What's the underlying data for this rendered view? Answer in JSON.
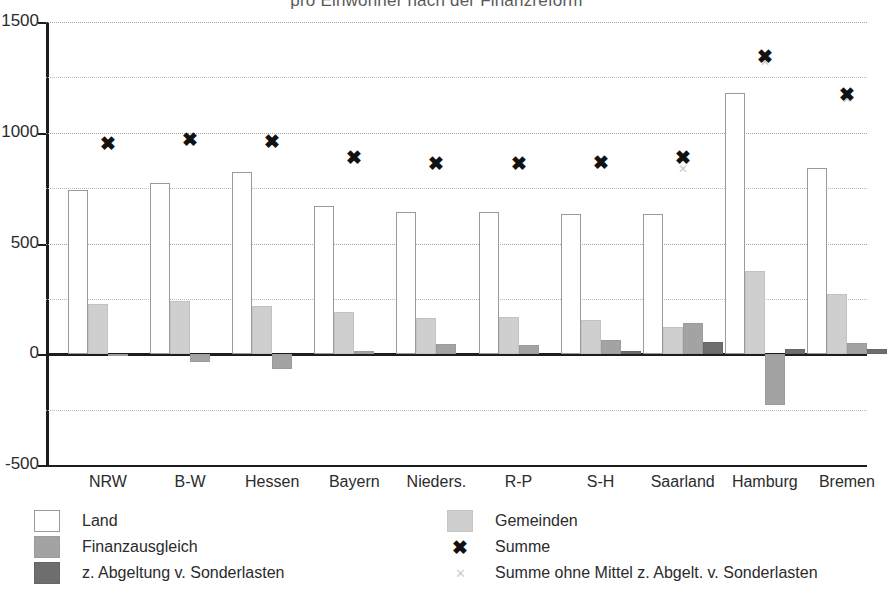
{
  "chart_data": {
    "type": "bar",
    "title": "pro Einwohner nach der Finanzreform",
    "xlabel": "",
    "ylabel": "",
    "ylim": [
      -500,
      1500
    ],
    "yticks": [
      1500,
      1000,
      500,
      0,
      -500
    ],
    "ytick_labels": [
      "1500",
      "1000",
      "500",
      "0",
      "-500"
    ],
    "grid": true,
    "grid_step": 250,
    "legend_position": "bottom",
    "categories": [
      "NRW",
      "B-W",
      "Hessen",
      "Bayern",
      "Nieders.",
      "R-P",
      "S-H",
      "Saarland",
      "Hamburg",
      "Bremen"
    ],
    "series": [
      {
        "name": "Land",
        "color": "#ffffff",
        "values": [
          740,
          775,
          825,
          670,
          640,
          640,
          635,
          635,
          1180,
          840
        ]
      },
      {
        "name": "Gemeinden",
        "color": "#cfcfcf",
        "values": [
          225,
          240,
          220,
          190,
          165,
          170,
          155,
          125,
          375,
          270
        ]
      },
      {
        "name": "Finanzausgleich",
        "color": "#a3a3a3",
        "values": [
          -5,
          -35,
          -65,
          15,
          45,
          40,
          65,
          140,
          -230,
          50
        ]
      },
      {
        "name": "z. Abgeltung v. Sonderlasten",
        "color": "#6e6e6e",
        "values": [
          0,
          0,
          0,
          0,
          0,
          0,
          15,
          55,
          25,
          22
        ]
      }
    ],
    "markers": [
      {
        "name": "Summe",
        "symbol": "✖",
        "color": "#111111",
        "values": [
          955,
          970,
          965,
          890,
          865,
          865,
          870,
          890,
          1345,
          1175
        ]
      },
      {
        "name": "Summe ohne Mittel z. Abgelt. v. Sonderlasten",
        "symbol": "✕",
        "color": "#c9c9c9",
        "values": [
          955,
          970,
          965,
          890,
          865,
          865,
          855,
          835,
          1320,
          1153
        ]
      }
    ]
  },
  "legend": {
    "left": [
      {
        "label": "Land",
        "swatch": "land"
      },
      {
        "label": "Finanzausgleich",
        "swatch": "finanz"
      },
      {
        "label": "z. Abgeltung v. Sonderlasten",
        "swatch": "sonder"
      }
    ],
    "right": [
      {
        "label": "Gemeinden",
        "swatch": "gemeinden"
      },
      {
        "label": "Summe",
        "swatch": "marker",
        "symbol": "✖"
      },
      {
        "label": "Summe ohne Mittel z. Abgelt. v. Sonderlasten",
        "swatch": "marker-light",
        "symbol": "✕"
      }
    ]
  }
}
